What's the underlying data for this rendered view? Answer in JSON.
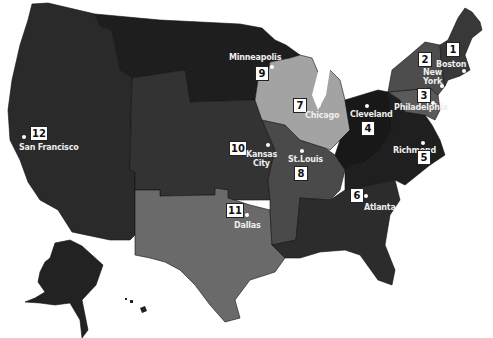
{
  "map": {
    "title": "Federal Reserve Districts",
    "colors": {
      "darkest": "#1e1e1e",
      "dark": "#2c2c2c",
      "medium_dark": "#3a3a3a",
      "medium": "#4d4d4d",
      "medium_light": "#6a6a6a",
      "light": "#a6a6a6",
      "labels": "#eeeeee",
      "background": "#ffffff"
    },
    "districts": [
      {
        "number": "1",
        "city": "Boston"
      },
      {
        "number": "2",
        "city": "New York",
        "city_line1": "New",
        "city_line2": "York"
      },
      {
        "number": "3",
        "city": "Philadelphia"
      },
      {
        "number": "4",
        "city": "Cleveland"
      },
      {
        "number": "5",
        "city": "Richmond"
      },
      {
        "number": "6",
        "city": "Atlanta"
      },
      {
        "number": "7",
        "city": "Chicago"
      },
      {
        "number": "8",
        "city": "St.Louis"
      },
      {
        "number": "9",
        "city": "Minneapolis"
      },
      {
        "number": "10",
        "city": "Kansas City",
        "city_line1": "Kansas",
        "city_line2": "City"
      },
      {
        "number": "11",
        "city": "Dallas"
      },
      {
        "number": "12",
        "city": "San Francisco"
      }
    ]
  }
}
